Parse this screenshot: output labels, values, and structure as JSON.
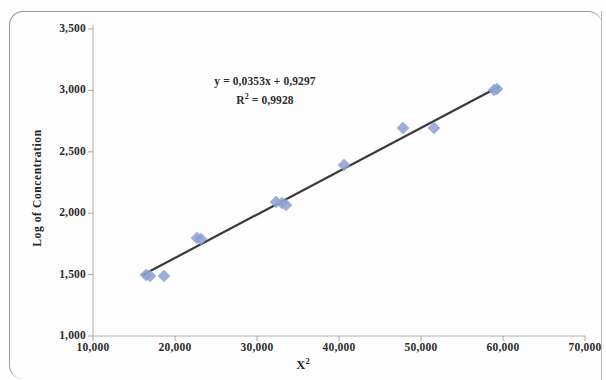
{
  "figure": {
    "border_color": "#9a9a9a",
    "background": "#ffffff"
  },
  "chart_data": {
    "type": "scatter",
    "title": "",
    "xlabel": "X²",
    "ylabel": "Log of Concentration",
    "xlim": [
      10000,
      70000
    ],
    "ylim": [
      1.0,
      3.5
    ],
    "grid": false,
    "legend": false,
    "marker_color": "#8ea2d2",
    "trendline_color": "#333333",
    "annotations": {
      "equation": "y = 0,0353x + 0,9297",
      "r_squared": "R² = 0,9928"
    },
    "xticks": [
      "10,000",
      "20,000",
      "30,000",
      "40,000",
      "50,000",
      "60,000",
      "70,000"
    ],
    "xtick_values": [
      10000,
      20000,
      30000,
      40000,
      50000,
      60000,
      70000
    ],
    "yticks": [
      "1,000",
      "1,500",
      "2,000",
      "2,500",
      "3,000",
      "3,500"
    ],
    "ytick_values": [
      1.0,
      1.5,
      2.0,
      2.5,
      3.0,
      3.5
    ],
    "x": [
      16500,
      16900,
      18600,
      22700,
      23200,
      32300,
      33100,
      33500,
      40600,
      47800,
      51600,
      58900,
      59300
    ],
    "y": [
      1.5,
      1.49,
      1.49,
      1.8,
      1.79,
      2.09,
      2.08,
      2.07,
      2.39,
      2.69,
      2.69,
      3.0,
      3.01
    ],
    "trendline": {
      "slope": 0.0353,
      "intercept": 0.9297,
      "x_start": 16000,
      "x_end": 59600
    }
  }
}
